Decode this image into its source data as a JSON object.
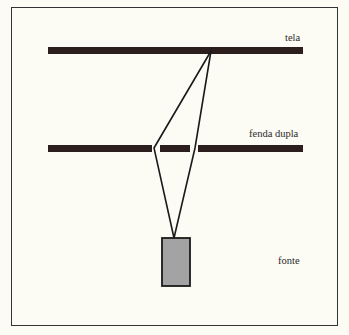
{
  "diagram": {
    "labels": {
      "screen": "tela",
      "slits": "fenda dupla",
      "source": "fonte"
    },
    "colors": {
      "background": "#fcfbf4",
      "bars": "#2b1e1c",
      "source_fill": "#a3a3a3",
      "lines": "#1a1a1a"
    }
  }
}
